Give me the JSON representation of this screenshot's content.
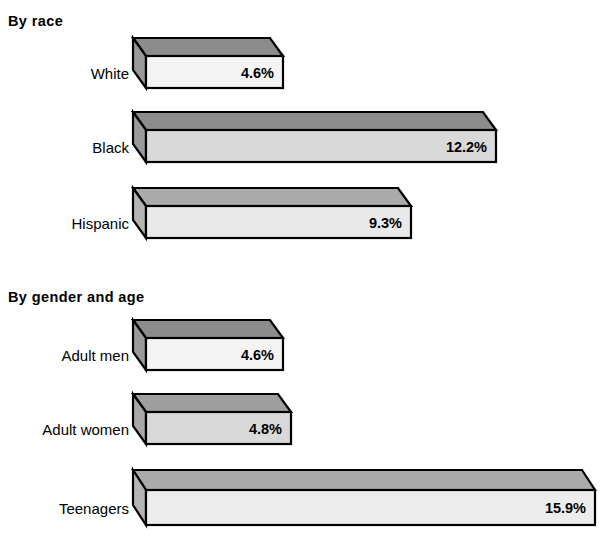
{
  "chart_data": {
    "type": "bar",
    "orientation": "horizontal",
    "title": "",
    "subtitle": "",
    "xlabel": "",
    "ylabel": "",
    "grid": false,
    "legend": null,
    "style_3d": true,
    "value_suffix": "%",
    "xlim": [
      0,
      17
    ],
    "groups": [
      {
        "heading": "By race",
        "categories": [
          "White",
          "Black",
          "Hispanic"
        ],
        "values": [
          4.6,
          12.2,
          9.3
        ],
        "value_labels": [
          "4.6%",
          "12.2%",
          "9.3%"
        ]
      },
      {
        "heading": "By gender and age",
        "categories": [
          "Adult men",
          "Adult women",
          "Teenagers"
        ],
        "values": [
          4.6,
          4.8,
          15.9
        ],
        "value_labels": [
          "4.6%",
          "4.8%",
          "15.9%"
        ]
      }
    ]
  },
  "headings": {
    "race": "By race",
    "gender": "By gender and age"
  },
  "bars": [
    {
      "label": "White",
      "value_label": "4.6%",
      "value": 4.6,
      "group": "By race",
      "geom": {
        "top": 38,
        "left": 133,
        "right": 283,
        "depth_x": 13,
        "depth_y": 18,
        "height": 32
      },
      "colors": {
        "top": "#8c8c8c",
        "side": "#9a9a9a",
        "front": "#f4f4f4"
      }
    },
    {
      "label": "Black",
      "value_label": "12.2%",
      "value": 12.2,
      "group": "By race",
      "geom": {
        "top": 112,
        "left": 133,
        "right": 496,
        "depth_x": 13,
        "depth_y": 18,
        "height": 32
      },
      "colors": {
        "top": "#8c8c8c",
        "side": "#9a9a9a",
        "front": "#d9d9d9"
      }
    },
    {
      "label": "Hispanic",
      "value_label": "9.3%",
      "value": 9.3,
      "group": "By race",
      "geom": {
        "top": 188,
        "left": 133,
        "right": 411,
        "depth_x": 13,
        "depth_y": 18,
        "height": 32
      },
      "colors": {
        "top": "#aaaaaa",
        "side": "#b4b4b4",
        "front": "#e9e9e9"
      }
    },
    {
      "label": "Adult men",
      "value_label": "4.6%",
      "value": 4.6,
      "group": "By gender and age",
      "geom": {
        "top": 320,
        "left": 133,
        "right": 283,
        "depth_x": 13,
        "depth_y": 18,
        "height": 32
      },
      "colors": {
        "top": "#8c8c8c",
        "side": "#9a9a9a",
        "front": "#f4f4f4"
      }
    },
    {
      "label": "Adult women",
      "value_label": "4.8%",
      "value": 4.8,
      "group": "By gender and age",
      "geom": {
        "top": 394,
        "left": 133,
        "right": 291,
        "depth_x": 13,
        "depth_y": 18,
        "height": 32
      },
      "colors": {
        "top": "#9e9e9e",
        "side": "#a8a8a8",
        "front": "#d9d9d9"
      }
    },
    {
      "label": "Teenagers",
      "value_label": "15.9%",
      "value": 15.9,
      "group": "By gender and age",
      "geom": {
        "top": 470,
        "left": 133,
        "right": 595,
        "depth_x": 13,
        "depth_y": 20,
        "height": 35
      },
      "colors": {
        "top": "#aaaaaa",
        "side": "#b4b4b4",
        "front": "#ececec"
      }
    }
  ]
}
